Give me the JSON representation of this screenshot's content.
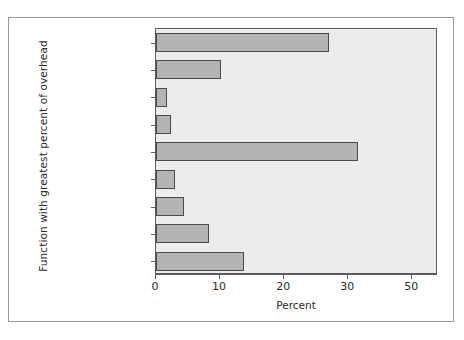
{
  "chart_data": {
    "type": "bar",
    "orientation": "horizontal",
    "title": "",
    "xlabel": "Percent",
    "ylabel": "Function with greatest percent of overhead",
    "categories": [
      "Operations\nmanagement",
      "Proposal\ndevelopment",
      "Legal",
      "Purchasing",
      "Business development\nand marketing",
      "Quality assurance\nand control",
      "Contracts\nadministration",
      "Human resources\nand recruiting",
      "Accounting\nand fiance"
    ],
    "values": [
      27.0,
      10.2,
      1.7,
      2.3,
      31.5,
      2.9,
      4.3,
      8.2,
      13.7
    ],
    "xlim": [
      0,
      44
    ],
    "xticks": [
      0,
      10,
      20,
      30,
      40
    ],
    "xtick_labels": [
      "0",
      "10",
      "20",
      "30",
      "50"
    ],
    "grid": false,
    "legend": false,
    "bar_fill": "#b4b4b4",
    "bar_edge": "#4a4a4a",
    "panel_bg": "#ececec",
    "axis_color": "#5c5c5c",
    "text_color": "#2b2b2b"
  }
}
